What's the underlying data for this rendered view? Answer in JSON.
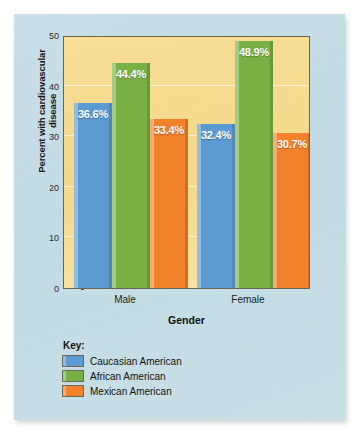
{
  "figure": {
    "panel_bg": "#c5dce4",
    "plot_bg": "#f5d98a"
  },
  "chart_data": {
    "type": "bar",
    "title": "",
    "subtitle": "",
    "xlabel": "Gender",
    "ylabel": "Percent with cardiovascular disease",
    "categories": [
      "Male",
      "Female"
    ],
    "ylim": [
      0,
      50
    ],
    "yticks": [
      0,
      10,
      20,
      30,
      40,
      50
    ],
    "ytick_labels": [
      "0",
      "10",
      "20",
      "30",
      "40",
      "50"
    ],
    "grid": "horizontal",
    "legend_position": "below-plot-left",
    "legend_title": "Key:",
    "series": [
      {
        "name": "Caucasian American",
        "color": "#5c9bd1",
        "values": [
          36.6,
          32.4
        ],
        "labels": [
          "36.6%",
          "32.4%"
        ]
      },
      {
        "name": "African American",
        "color": "#79b043",
        "values": [
          44.4,
          48.9
        ],
        "labels": [
          "44.4%",
          "48.9%"
        ]
      },
      {
        "name": "Mexican American",
        "color": "#f1812a",
        "values": [
          33.4,
          30.7
        ],
        "labels": [
          "33.4%",
          "30.7%"
        ]
      }
    ]
  }
}
